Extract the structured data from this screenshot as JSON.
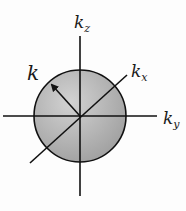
{
  "diagram": {
    "type": "k-space sphere",
    "labels": {
      "kz": {
        "base": "k",
        "sub": "z"
      },
      "kx": {
        "base": "k",
        "sub": "x"
      },
      "ky": {
        "base": "k",
        "sub": "y"
      },
      "k": "k"
    },
    "colors": {
      "sphere_fill_light": "#d4d4d4",
      "sphere_fill_dark": "#9a9a9a",
      "stroke": "#111111"
    }
  }
}
